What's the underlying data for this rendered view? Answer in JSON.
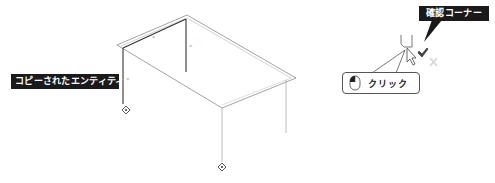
{
  "diagram": {
    "type": "isometric-cad-illustration",
    "labels": {
      "copied_entities": "コピーされたエンティティ",
      "confirmation_corner": "確認コーナー",
      "click": "クリック"
    },
    "icons": {
      "mouse": "mouse-left-click-icon",
      "cursor": "arrow-cursor-icon",
      "confirm_check": "checkmark-icon",
      "cancel": "x-icon"
    },
    "colors": {
      "label_bg": "#1a1a1a",
      "label_text": "#ffffff",
      "line_dark": "#333333",
      "line_light": "#9a9a9a"
    }
  }
}
